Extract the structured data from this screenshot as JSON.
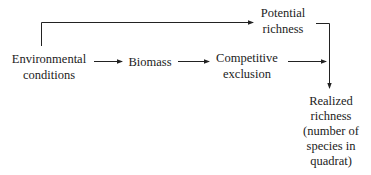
{
  "nodes": {
    "potential": {
      "line1": "Potential",
      "line2": "richness"
    },
    "environmental": {
      "line1": "Environmental",
      "line2": "conditions"
    },
    "biomass": {
      "line1": "Biomass"
    },
    "competitive": {
      "line1": "Competitive",
      "line2": "exclusion"
    },
    "realized": {
      "line1": "Realized",
      "line2": "richness",
      "line3": "(number of",
      "line4": "species in",
      "line5": "quadrat)"
    }
  },
  "edges": [
    {
      "from": "environmental",
      "to": "potential"
    },
    {
      "from": "environmental",
      "to": "biomass"
    },
    {
      "from": "biomass",
      "to": "competitive"
    },
    {
      "from": "competitive",
      "to": "realized"
    },
    {
      "from": "potential",
      "to": "realized"
    }
  ]
}
